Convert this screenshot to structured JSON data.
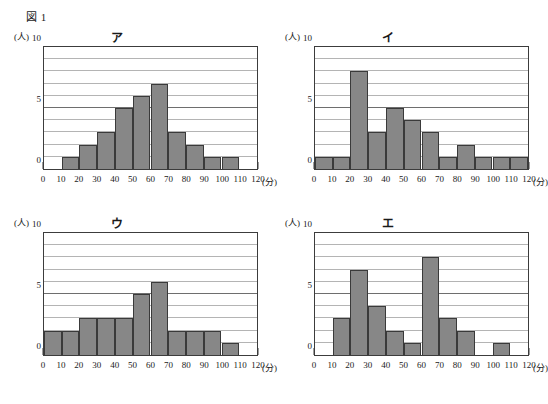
{
  "figure": {
    "label": "図 1"
  },
  "axis": {
    "y_unit": "(人)",
    "x_unit": "(分)",
    "y_ticks": [
      {
        "value": 0,
        "label": "0"
      },
      {
        "value": 5,
        "label": "5"
      },
      {
        "value": 10,
        "label": "10"
      }
    ],
    "x_ticks": [
      {
        "value": 0,
        "label": "0"
      },
      {
        "value": 10,
        "label": "10"
      },
      {
        "value": 20,
        "label": "20"
      },
      {
        "value": 30,
        "label": "30"
      },
      {
        "value": 40,
        "label": "40"
      },
      {
        "value": 50,
        "label": "50"
      },
      {
        "value": 60,
        "label": "60"
      },
      {
        "value": 70,
        "label": "70"
      },
      {
        "value": 80,
        "label": "80"
      },
      {
        "value": 90,
        "label": "90"
      },
      {
        "value": 100,
        "label": "100"
      },
      {
        "value": 110,
        "label": "110"
      },
      {
        "value": 120,
        "label": "120"
      }
    ],
    "gridline_values": [
      1,
      2,
      3,
      4,
      5,
      6,
      7,
      8,
      9
    ],
    "major_gridline_values": [
      5
    ]
  },
  "colors": {
    "bar_fill": "#878787",
    "bar_stroke": "#3a3a3a",
    "frame": "#3c3c3c",
    "gridline": "#b4b4b4",
    "gridline_major": "#6e6e6e",
    "background": "#ffffff",
    "text": "#1a1a1a"
  },
  "chart_data": [
    {
      "type": "bar",
      "title": "ア",
      "xlabel": "(分)",
      "ylabel": "(人)",
      "xlim": [
        0,
        120
      ],
      "ylim": [
        0,
        10
      ],
      "grid": true,
      "legend": "none",
      "bin_width": 10,
      "categories": [
        "0-10",
        "10-20",
        "20-30",
        "30-40",
        "40-50",
        "50-60",
        "60-70",
        "70-80",
        "80-90",
        "90-100",
        "100-110",
        "110-120"
      ],
      "values": [
        0,
        1,
        2,
        3,
        5,
        6,
        7,
        3,
        2,
        1,
        1,
        0
      ]
    },
    {
      "type": "bar",
      "title": "イ",
      "xlabel": "(分)",
      "ylabel": "(人)",
      "xlim": [
        0,
        120
      ],
      "ylim": [
        0,
        10
      ],
      "grid": true,
      "legend": "none",
      "bin_width": 10,
      "categories": [
        "0-10",
        "10-20",
        "20-30",
        "30-40",
        "40-50",
        "50-60",
        "60-70",
        "70-80",
        "80-90",
        "90-100",
        "100-110",
        "110-120"
      ],
      "values": [
        1,
        1,
        8,
        3,
        5,
        4,
        3,
        1,
        2,
        1,
        1,
        1
      ]
    },
    {
      "type": "bar",
      "title": "ウ",
      "xlabel": "(分)",
      "ylabel": "(人)",
      "xlim": [
        0,
        120
      ],
      "ylim": [
        0,
        10
      ],
      "grid": true,
      "legend": "none",
      "bin_width": 10,
      "categories": [
        "0-10",
        "10-20",
        "20-30",
        "30-40",
        "40-50",
        "50-60",
        "60-70",
        "70-80",
        "80-90",
        "90-100",
        "100-110",
        "110-120"
      ],
      "values": [
        2,
        2,
        3,
        3,
        3,
        5,
        6,
        2,
        2,
        2,
        1,
        0
      ]
    },
    {
      "type": "bar",
      "title": "エ",
      "xlabel": "(分)",
      "ylabel": "(人)",
      "xlim": [
        0,
        120
      ],
      "ylim": [
        0,
        10
      ],
      "grid": true,
      "legend": "none",
      "bin_width": 10,
      "categories": [
        "0-10",
        "10-20",
        "20-30",
        "30-40",
        "40-50",
        "50-60",
        "60-70",
        "70-80",
        "80-90",
        "90-100",
        "100-110",
        "110-120"
      ],
      "values": [
        0,
        3,
        7,
        4,
        2,
        1,
        8,
        3,
        2,
        0,
        1,
        0
      ]
    }
  ]
}
